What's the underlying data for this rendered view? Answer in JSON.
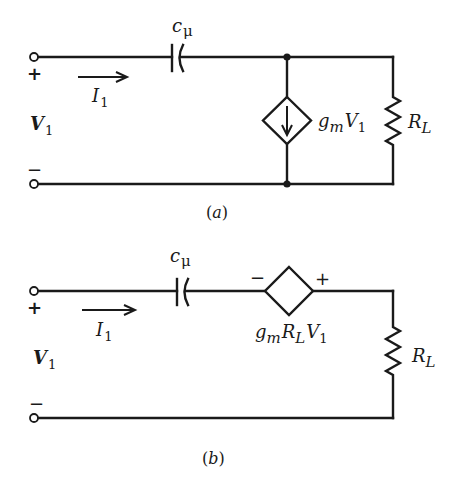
{
  "figure": {
    "panels": [
      {
        "id": "a",
        "caption": "(a)",
        "caption_paren_open": "(",
        "caption_letter": "a",
        "caption_paren_close": ")",
        "capacitor_label": {
          "main": "c",
          "sub": "μ"
        },
        "current_label": {
          "main": "I",
          "sub": "1"
        },
        "voltage_label": {
          "main": "V",
          "sub": "1"
        },
        "plus_sign": "+",
        "minus_sign": "−",
        "dependent_source": {
          "type": "current",
          "direction": "down",
          "label_parts": {
            "g": "g",
            "g_sub": "m",
            "v": "V",
            "v_sub": "1"
          }
        },
        "load_label": {
          "main": "R",
          "sub": "L"
        }
      },
      {
        "id": "b",
        "caption": "(b)",
        "caption_paren_open": "(",
        "caption_letter": "b",
        "caption_paren_close": ")",
        "capacitor_label": {
          "main": "c",
          "sub": "μ"
        },
        "current_label": {
          "main": "I",
          "sub": "1"
        },
        "voltage_label": {
          "main": "V",
          "sub": "1"
        },
        "plus_sign": "+",
        "minus_sign": "−",
        "dependent_source": {
          "type": "voltage",
          "polarity_left": "−",
          "polarity_right": "+",
          "label_parts": {
            "g": "g",
            "g_sub": "m",
            "r": "R",
            "r_sub": "L",
            "v": "V",
            "v_sub": "1"
          }
        },
        "load_label": {
          "main": "R",
          "sub": "L"
        }
      }
    ],
    "colors": {
      "ink": "#1a1a1a",
      "background": "#ffffff"
    }
  }
}
